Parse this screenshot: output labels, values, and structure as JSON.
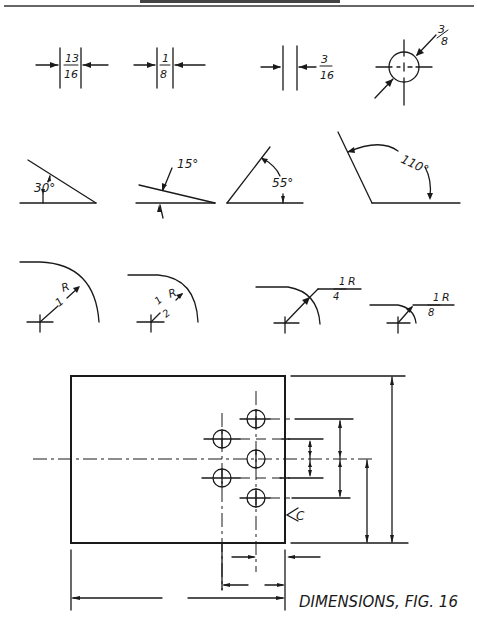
{
  "page": {
    "header_text": "HOW TO READ BLUEPRINTS",
    "caption": "DIMENSIONS, FIG. 16"
  },
  "row_linear": [
    {
      "num": "13",
      "den": "16"
    },
    {
      "num": "1",
      "den": "8"
    },
    {
      "num": "3",
      "den": "16"
    },
    {
      "num": "3",
      "den": "8"
    }
  ],
  "row_angles": [
    "30°",
    "15°",
    "55°",
    "110°"
  ],
  "row_radii": [
    {
      "value": "1",
      "unit": "R"
    },
    {
      "num": "1",
      "den": "2",
      "unit": "R"
    },
    {
      "num": "1",
      "den": "4",
      "unit": "R"
    },
    {
      "num": "1",
      "den": "8",
      "unit": "R"
    }
  ],
  "plate": {
    "center_mark": "C",
    "hole_count": 5
  }
}
